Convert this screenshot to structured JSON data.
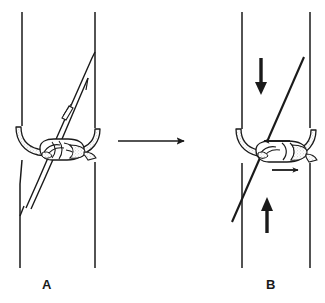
{
  "figure": {
    "type": "line-drawing-diagram",
    "background_color": "#ffffff",
    "ink_color": "#1a1a1a",
    "width": 325,
    "height": 303
  },
  "panels": [
    {
      "id": "A",
      "label": "A",
      "caption": "A",
      "description": "Hitch tied loosely around a vertical pole, rope running diagonally from lower-left to upper-right",
      "label_position": {
        "x": 42,
        "y": 278
      },
      "pole": {
        "left_edge_x": 22,
        "right_edge_x": 95,
        "top_y": 12,
        "bottom_y": 268
      },
      "rope_detail": {
        "name": "rope-clip",
        "description": "small rectangular clip marker on the rope strand",
        "x": 66,
        "y": 113
      },
      "arrows": []
    },
    {
      "id": "B",
      "label": "B",
      "caption": "B",
      "description": "Same hitch under load — arrows show pole moving down, rope pulled up, and hitch legs tightening sideways",
      "label_position": {
        "x": 266,
        "y": 278
      },
      "pole": {
        "left_edge_x": 242,
        "right_edge_x": 310,
        "top_y": 12,
        "bottom_y": 268
      },
      "arrows": [
        {
          "name": "arrow-pole-down",
          "direction": "down",
          "x": 261,
          "y_start": 58,
          "y_end": 92
        },
        {
          "name": "arrow-pole-up",
          "direction": "up",
          "x": 267,
          "y_start": 233,
          "y_end": 199
        },
        {
          "name": "arrow-hitch-left",
          "direction": "left",
          "y": 141,
          "x_start": 290,
          "x_end": 259
        },
        {
          "name": "arrow-hitch-right",
          "direction": "right",
          "y": 170,
          "x_start": 272,
          "x_end": 303
        }
      ]
    }
  ],
  "transition_arrow": {
    "name": "transition-arrow",
    "direction": "right",
    "x_start": 118,
    "x_end": 186,
    "y": 141
  },
  "colors": {
    "ink": "#1a1a1a",
    "rope_fill": "#ffffff",
    "rope_stipple": "#8c8c8c",
    "background": "#ffffff"
  }
}
